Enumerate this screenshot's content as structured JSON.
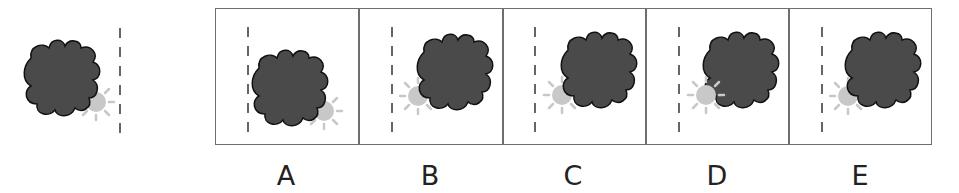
{
  "question": {
    "reference_figure": {
      "description": "dark cloud with light sun at lower-right, dashed vertical line to the right"
    },
    "options": [
      {
        "label": "A"
      },
      {
        "label": "B"
      },
      {
        "label": "C"
      },
      {
        "label": "D"
      },
      {
        "label": "E"
      }
    ]
  },
  "colors": {
    "cloud_fill": "#4a4a4a",
    "cloud_stroke": "#111111",
    "sun_fill": "#c8c8c8",
    "sun_rays": "#c8c8c8",
    "dash_line": "#555555",
    "border": "#6e6e6e",
    "label": "#222222"
  }
}
